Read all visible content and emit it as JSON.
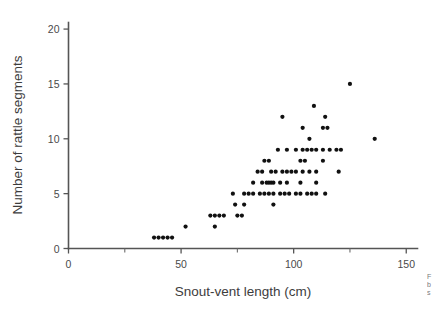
{
  "chart_data": {
    "type": "scatter",
    "title": "",
    "xlabel": "Snout-vent length (cm)",
    "ylabel": "Number of rattle segments",
    "xlim": [
      0,
      155
    ],
    "ylim": [
      0,
      20.6
    ],
    "xticks": [
      0,
      50,
      100,
      150
    ],
    "xtick_labels": [
      "0",
      "50",
      "100",
      "150"
    ],
    "xminor_ticks": [
      25,
      75,
      125
    ],
    "yticks": [
      0,
      5,
      10,
      15,
      20
    ],
    "ytick_labels": [
      "0",
      "5",
      "10",
      "15",
      "20"
    ],
    "grid": false,
    "legend": null,
    "marker": "filled-circle",
    "marker_color": "#111111",
    "axis_color": "#555555",
    "points": [
      [
        38,
        1
      ],
      [
        40,
        1
      ],
      [
        42,
        1
      ],
      [
        44,
        1
      ],
      [
        46,
        1
      ],
      [
        52,
        2
      ],
      [
        65,
        2
      ],
      [
        63,
        3
      ],
      [
        65,
        3
      ],
      [
        67,
        3
      ],
      [
        69,
        3
      ],
      [
        75,
        3
      ],
      [
        77,
        3
      ],
      [
        74,
        4
      ],
      [
        78,
        4
      ],
      [
        91,
        4
      ],
      [
        73,
        5
      ],
      [
        78,
        5
      ],
      [
        80,
        5
      ],
      [
        82,
        5
      ],
      [
        85,
        5
      ],
      [
        87,
        5
      ],
      [
        89,
        5
      ],
      [
        91,
        5
      ],
      [
        94,
        5
      ],
      [
        96,
        5
      ],
      [
        98,
        5
      ],
      [
        101,
        5
      ],
      [
        103,
        5
      ],
      [
        106,
        5
      ],
      [
        108,
        5
      ],
      [
        110,
        5
      ],
      [
        114,
        5
      ],
      [
        82,
        6
      ],
      [
        86,
        6
      ],
      [
        88,
        6
      ],
      [
        89,
        6
      ],
      [
        90,
        6
      ],
      [
        91,
        6
      ],
      [
        94,
        6
      ],
      [
        97,
        6
      ],
      [
        103,
        6
      ],
      [
        110,
        6
      ],
      [
        84,
        7
      ],
      [
        86,
        7
      ],
      [
        90,
        7
      ],
      [
        92,
        7
      ],
      [
        95,
        7
      ],
      [
        97,
        7
      ],
      [
        99,
        7
      ],
      [
        101,
        7
      ],
      [
        104,
        7
      ],
      [
        107,
        7
      ],
      [
        110,
        7
      ],
      [
        120,
        7
      ],
      [
        87,
        8
      ],
      [
        89,
        8
      ],
      [
        103,
        8
      ],
      [
        105,
        8
      ],
      [
        113,
        8
      ],
      [
        93,
        9
      ],
      [
        97,
        9
      ],
      [
        101,
        9
      ],
      [
        104,
        9
      ],
      [
        106,
        9
      ],
      [
        108,
        9
      ],
      [
        110,
        9
      ],
      [
        113,
        9
      ],
      [
        116,
        9
      ],
      [
        119,
        9
      ],
      [
        121,
        9
      ],
      [
        107,
        10
      ],
      [
        136,
        10
      ],
      [
        104,
        11
      ],
      [
        113,
        11
      ],
      [
        115,
        11
      ],
      [
        95,
        12
      ],
      [
        114,
        12
      ],
      [
        109,
        13
      ],
      [
        125,
        15
      ]
    ]
  },
  "side_note": {
    "line1": "F",
    "line2": "b",
    "line3": "s"
  }
}
